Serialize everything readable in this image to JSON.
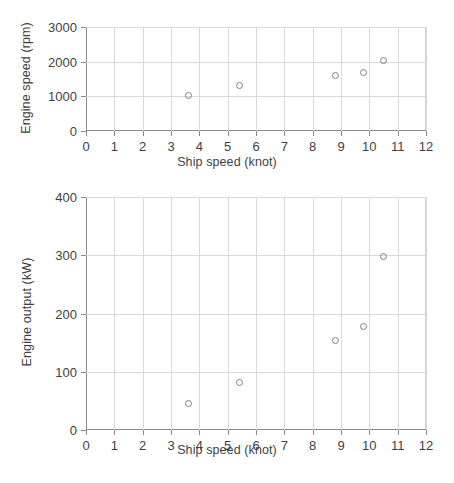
{
  "figure": {
    "background": "#ffffff",
    "marker_color": "#808080",
    "grid_color": "#d9d9d9",
    "axis_color": "#8a8a8a",
    "text_color": "#3f3f3f"
  },
  "chart_data": [
    {
      "type": "scatter",
      "title": "",
      "xlabel": "Ship speed (knot)",
      "ylabel": "Engine speed (rpm)",
      "xlim": [
        0,
        12
      ],
      "ylim": [
        0,
        3000
      ],
      "xticks": [
        0,
        1,
        2,
        3,
        4,
        5,
        6,
        7,
        8,
        9,
        10,
        11,
        12
      ],
      "xticklabels": [
        "0",
        "1",
        "2",
        "3",
        "4",
        "5",
        "6",
        "7",
        "8",
        "9",
        "10",
        "11",
        "12"
      ],
      "yticks": [
        0,
        1000,
        2000,
        3000
      ],
      "yticklabels": [
        "0",
        "1000",
        "2000",
        "3000"
      ],
      "grid": true,
      "legend": false,
      "marker": "open-circle",
      "x": [
        3.6,
        5.4,
        8.8,
        9.8,
        10.5
      ],
      "y": [
        1010,
        1300,
        1600,
        1690,
        2030
      ],
      "points": [
        {
          "x": 3.6,
          "y": 1010
        },
        {
          "x": 5.4,
          "y": 1300
        },
        {
          "x": 8.8,
          "y": 1600
        },
        {
          "x": 9.8,
          "y": 1690
        },
        {
          "x": 10.5,
          "y": 2030
        }
      ]
    },
    {
      "type": "scatter",
      "title": "",
      "xlabel": "Ship speed (knot)",
      "ylabel": "Engine output (kW)",
      "xlim": [
        0,
        12
      ],
      "ylim": [
        0,
        400
      ],
      "xticks": [
        0,
        1,
        2,
        3,
        4,
        5,
        6,
        7,
        8,
        9,
        10,
        11,
        12
      ],
      "xticklabels": [
        "0",
        "1",
        "2",
        "3",
        "4",
        "5",
        "6",
        "7",
        "8",
        "9",
        "10",
        "11",
        "12"
      ],
      "yticks": [
        0,
        100,
        200,
        300,
        400
      ],
      "yticklabels": [
        "0",
        "100",
        "200",
        "300",
        "400"
      ],
      "grid": true,
      "legend": false,
      "marker": "open-circle",
      "x": [
        3.6,
        5.4,
        8.8,
        9.8,
        10.5
      ],
      "y": [
        45,
        81,
        153,
        178,
        297
      ],
      "points": [
        {
          "x": 3.6,
          "y": 45
        },
        {
          "x": 5.4,
          "y": 81
        },
        {
          "x": 8.8,
          "y": 153
        },
        {
          "x": 9.8,
          "y": 178
        },
        {
          "x": 10.5,
          "y": 297
        }
      ]
    }
  ]
}
